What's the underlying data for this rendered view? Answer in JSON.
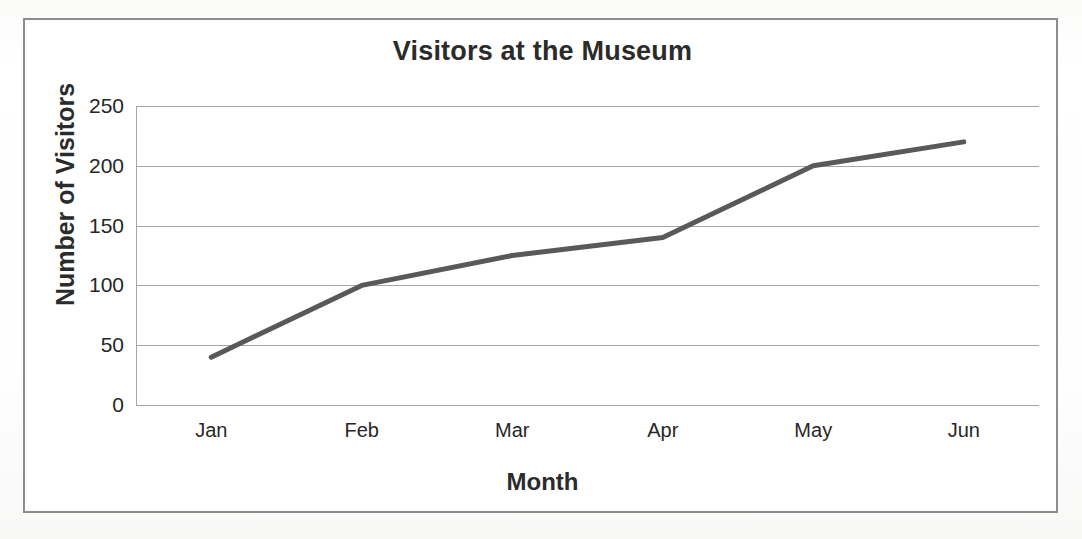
{
  "chart_data": {
    "type": "line",
    "title": "Visitors at the Museum",
    "xlabel": "Month",
    "ylabel": "Number of Visitors",
    "categories": [
      "Jan",
      "Feb",
      "Mar",
      "Apr",
      "May",
      "Jun"
    ],
    "series": [
      {
        "name": "Number of Visitors",
        "values": [
          40,
          100,
          125,
          140,
          200,
          220
        ],
        "color": "#595959",
        "line_width": 5,
        "markers": false
      }
    ],
    "ylim": [
      0,
      250
    ],
    "yticks": [
      0,
      50,
      100,
      150,
      200,
      250
    ],
    "ytick_labels": [
      "0",
      "50",
      "100",
      "150",
      "200",
      "250"
    ],
    "grid": {
      "horizontal": true,
      "vertical": false,
      "color": "#a6a6a6"
    },
    "legend": {
      "visible": false,
      "position": "none"
    },
    "frame": {
      "outer_border": true,
      "outer_border_color": "#8d8d8d",
      "background": "#ffffff"
    }
  },
  "axis": {
    "y_tick_0": "0",
    "y_tick_1": "50",
    "y_tick_2": "100",
    "y_tick_3": "150",
    "y_tick_4": "200",
    "y_tick_5": "250",
    "x_tick_0": "Jan",
    "x_tick_1": "Feb",
    "x_tick_2": "Mar",
    "x_tick_3": "Apr",
    "x_tick_4": "May",
    "x_tick_5": "Jun"
  }
}
